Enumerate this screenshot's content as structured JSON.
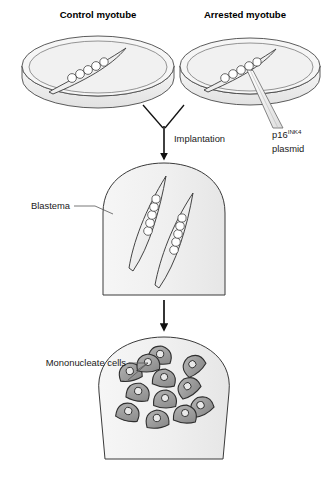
{
  "figure": {
    "title_control": "Control myotube",
    "title_arrested": "Arrested myotube",
    "label_implantation": "Implantation",
    "label_plasmid_base": "p16",
    "label_plasmid_sup": "INK4",
    "label_plasmid_second_line": "plasmid",
    "label_blastema": "Blastema",
    "label_mononucleate": "Mononucleate cells"
  },
  "colors": {
    "background": "#ffffff",
    "outline": "#3a3a3a",
    "outline_dark": "#1a1a1a",
    "dish_fill": "#f4f4f4",
    "dish_rim_fill": "#ebebeb",
    "blastema_fill": "#f1f1f1",
    "myotube_fill": "#fbfbfb",
    "nucleus_fill": "#ffffff",
    "cell_fill": "#9d9d9d",
    "cell_nucleus_fill": "#e8e8e8",
    "pipette_fill": "#f0f0f0",
    "text": "#1a1a1a",
    "text_bold": "#000000",
    "arrow": "#111111"
  },
  "diagram": {
    "type": "biological-schematic",
    "panels": [
      {
        "name": "control-dish",
        "description": "petri dish containing one multinucleate myotube",
        "nuclei_count": 5
      },
      {
        "name": "arrested-dish",
        "description": "petri dish containing one multinucleate myotube injected by micropipette",
        "nuclei_count": 5
      },
      {
        "name": "blastema-with-myotubes",
        "description": "dome-shaped blastema containing two implanted myotubes",
        "myotube_count": 2,
        "nuclei_per_myotube": 5
      },
      {
        "name": "blastema-with-mononucleate-cells",
        "description": "dome-shaped blastema containing dispersed mononucleate cells",
        "cell_count": 12
      }
    ],
    "arrows": [
      {
        "name": "converging-implantation-arrow",
        "from": "both dishes",
        "to": "blastema"
      },
      {
        "name": "transition-arrow",
        "from": "blastema-with-myotubes",
        "to": "blastema-with-mononucleate-cells"
      }
    ]
  }
}
